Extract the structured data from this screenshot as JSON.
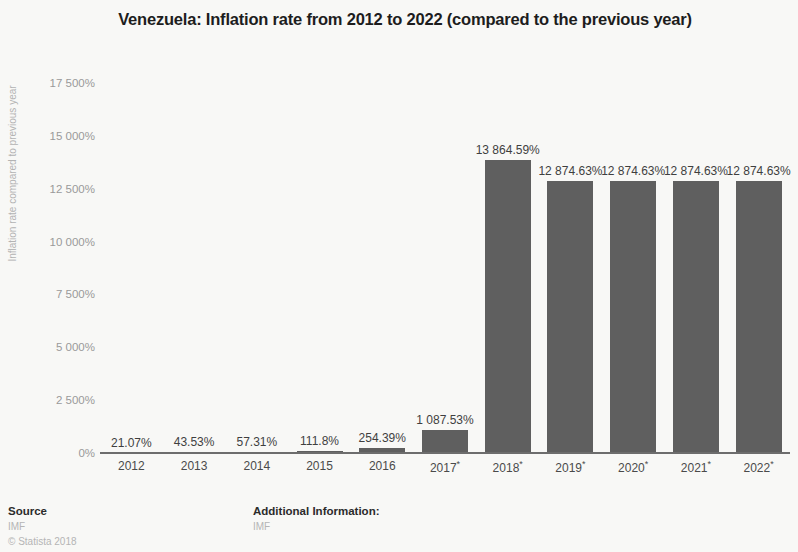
{
  "chart_data": {
    "type": "bar",
    "title": "Venezuela: Inflation rate from 2012 to 2022 (compared to the previous year)",
    "xlabel": "",
    "ylabel": "Inflation rate compared to previous year",
    "ylim": [
      0,
      17500
    ],
    "grid": false,
    "legend": "none",
    "categories": [
      "2012",
      "2013",
      "2014",
      "2015",
      "2016",
      "2017*",
      "2018*",
      "2019*",
      "2020*",
      "2021*",
      "2022*"
    ],
    "values": [
      21.07,
      43.53,
      57.31,
      111.8,
      254.39,
      1087.53,
      13864.59,
      12874.63,
      12874.63,
      12874.63,
      12874.63
    ],
    "value_labels": [
      "21.07%",
      "43.53%",
      "57.31%",
      "111.8%",
      "254.39%",
      "1 087.53%",
      "13 864.59%",
      "12 874.63%",
      "12 874.63%",
      "12 874.63%",
      "12 874.63%"
    ],
    "y_ticks": [
      0,
      2500,
      5000,
      7500,
      10000,
      12500,
      15000,
      17500
    ],
    "y_tick_labels": [
      "0%",
      "2 500%",
      "5 000%",
      "7 500%",
      "10 000%",
      "12 500%",
      "15 000%",
      "17 500%"
    ],
    "bar_color": "#5f5f5f",
    "background_color": "#f8f8f6",
    "axis_color": "#6d6d6d"
  },
  "footer": {
    "source_heading": "Source",
    "source_value": "IMF",
    "copyright": "© Statista 2018",
    "info_heading": "Additional Information:",
    "info_value": "IMF"
  }
}
